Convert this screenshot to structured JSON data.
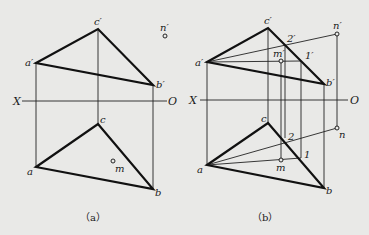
{
  "figures": [
    {
      "id": "a",
      "caption": "（a）",
      "axis": {
        "left_label": "X",
        "right_label": "O"
      },
      "points": {
        "a_prime": "a′",
        "b_prime": "b′",
        "c_prime": "c′",
        "n_prime": "n′",
        "a": "a",
        "b": "b",
        "c": "c",
        "m": "m"
      }
    },
    {
      "id": "b",
      "caption": "（b）",
      "axis": {
        "left_label": "X",
        "right_label": "O"
      },
      "points": {
        "a_prime": "a′",
        "b_prime": "b′",
        "c_prime": "c′",
        "n_prime": "n′",
        "m_prime": "m′",
        "one_prime": "1′",
        "two_prime": "2′",
        "a": "a",
        "b": "b",
        "c": "c",
        "n": "n",
        "m": "m",
        "one": "1",
        "two": "2"
      }
    }
  ],
  "colors": {
    "background": "#e9e9e7",
    "ink": "#111111"
  }
}
